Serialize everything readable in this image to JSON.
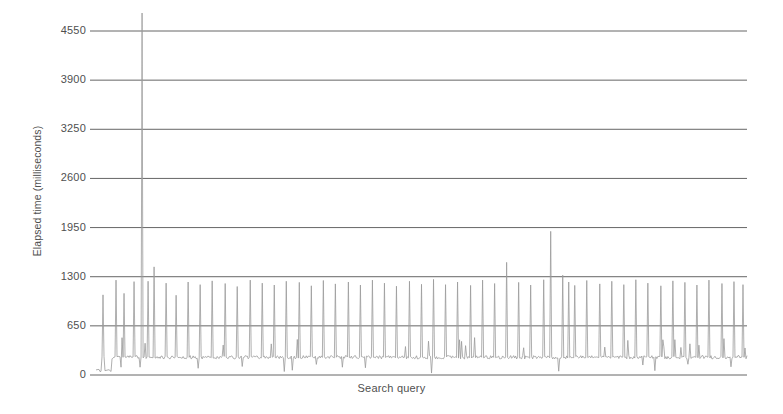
{
  "chart_data": {
    "type": "line",
    "title": "",
    "xlabel": "Search query",
    "ylabel": "Elapsed time (milliseconds)",
    "ylim": [
      0,
      4550
    ],
    "yticks": [
      0,
      650,
      1300,
      1950,
      2600,
      3250,
      3900,
      4550
    ],
    "ytick_labels": [
      "0",
      "650",
      "1300",
      "1950",
      "2600",
      "3250",
      "3900",
      "4550"
    ],
    "xticks": [],
    "xtick_labels": [],
    "grid": "horizontal",
    "legend": "none",
    "series_name": "elapsed time per search query",
    "n_points": 651,
    "baseline_ms": 235,
    "baseline_noise_ms": 45,
    "warmup_plateau_ms": 60,
    "warmup_end_index": 16,
    "typical_spike_ms": 1200,
    "max_spike_ms": 5400,
    "max_spike_index": 46,
    "max_visible_spike_ms": 1900,
    "max_visible_spike_index": 454,
    "spikes": [
      {
        "index": 7,
        "value": 1060
      },
      {
        "index": 20,
        "value": 1255
      },
      {
        "index": 28,
        "value": 1080
      },
      {
        "index": 38,
        "value": 1235
      },
      {
        "index": 46,
        "value": 5400
      },
      {
        "index": 52,
        "value": 1240
      },
      {
        "index": 58,
        "value": 1430
      },
      {
        "index": 70,
        "value": 1215
      },
      {
        "index": 80,
        "value": 1055
      },
      {
        "index": 92,
        "value": 1230
      },
      {
        "index": 104,
        "value": 1195
      },
      {
        "index": 116,
        "value": 1245
      },
      {
        "index": 129,
        "value": 1210
      },
      {
        "index": 141,
        "value": 1170
      },
      {
        "index": 154,
        "value": 1255
      },
      {
        "index": 166,
        "value": 1215
      },
      {
        "index": 178,
        "value": 1190
      },
      {
        "index": 190,
        "value": 1240
      },
      {
        "index": 203,
        "value": 1225
      },
      {
        "index": 215,
        "value": 1180
      },
      {
        "index": 227,
        "value": 1250
      },
      {
        "index": 239,
        "value": 1205
      },
      {
        "index": 252,
        "value": 1230
      },
      {
        "index": 264,
        "value": 1190
      },
      {
        "index": 276,
        "value": 1255
      },
      {
        "index": 288,
        "value": 1215
      },
      {
        "index": 300,
        "value": 1175
      },
      {
        "index": 313,
        "value": 1240
      },
      {
        "index": 325,
        "value": 1200
      },
      {
        "index": 337,
        "value": 1265
      },
      {
        "index": 349,
        "value": 1195
      },
      {
        "index": 361,
        "value": 1230
      },
      {
        "index": 374,
        "value": 1185
      },
      {
        "index": 386,
        "value": 1255
      },
      {
        "index": 398,
        "value": 1210
      },
      {
        "index": 410,
        "value": 1490
      },
      {
        "index": 422,
        "value": 1225
      },
      {
        "index": 434,
        "value": 1190
      },
      {
        "index": 447,
        "value": 1260
      },
      {
        "index": 454,
        "value": 1900
      },
      {
        "index": 466,
        "value": 1320
      },
      {
        "index": 472,
        "value": 1230
      },
      {
        "index": 478,
        "value": 1185
      },
      {
        "index": 490,
        "value": 1250
      },
      {
        "index": 503,
        "value": 1205
      },
      {
        "index": 515,
        "value": 1240
      },
      {
        "index": 527,
        "value": 1195
      },
      {
        "index": 539,
        "value": 1260
      },
      {
        "index": 551,
        "value": 1215
      },
      {
        "index": 564,
        "value": 1180
      },
      {
        "index": 576,
        "value": 1245
      },
      {
        "index": 588,
        "value": 1225
      },
      {
        "index": 600,
        "value": 1190
      },
      {
        "index": 612,
        "value": 1255
      },
      {
        "index": 625,
        "value": 1210
      },
      {
        "index": 637,
        "value": 1235
      },
      {
        "index": 646,
        "value": 1195
      }
    ]
  },
  "axes": {
    "y_title": "Elapsed time (milliseconds)",
    "x_title": "Search query",
    "y_labels": [
      "4550",
      "3900",
      "3250",
      "2600",
      "1950",
      "1300",
      "650",
      "0"
    ]
  },
  "colors": {
    "background": "#ffffff",
    "gridline": "#555555",
    "trace": "#9a9a9a",
    "text": "#4f4f4f"
  }
}
